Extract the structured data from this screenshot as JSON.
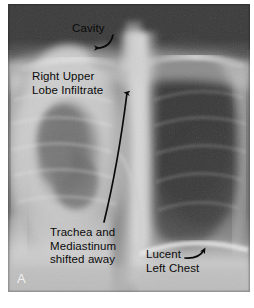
{
  "figure": {
    "type": "radiograph",
    "modality": "chest-x-ray",
    "view": "frontal",
    "panel_letter": "A",
    "panel_letter_color": "#efefef",
    "annotation_color": "#0a0a0a",
    "plate_background": "#6f6f6f",
    "paper_background": "#ffffff"
  },
  "annotations": {
    "cavity": {
      "label": "Cavity",
      "arrow": "curved-arrow-down-left",
      "points_to": "right-upper-lobe-cavitary-lesion"
    },
    "right_upper_lobe": {
      "line1": "Right Upper",
      "line2": "Lobe Infiltrate",
      "arrow": "long-curved-arrow-up",
      "points_to": "right-upper-lobe-opacity"
    },
    "trachea": {
      "line1": "Trachea and",
      "line2": "Mediastinum",
      "line3": "shifted away",
      "arrow": "long-curved-arrow-up",
      "points_to": "mediastinal-shift"
    },
    "lucent_left_chest": {
      "line1": "Lucent",
      "line2": "Left Chest",
      "arrow": "curved-arrow-up-right",
      "points_to": "hyperlucent-left-hemithorax"
    }
  }
}
